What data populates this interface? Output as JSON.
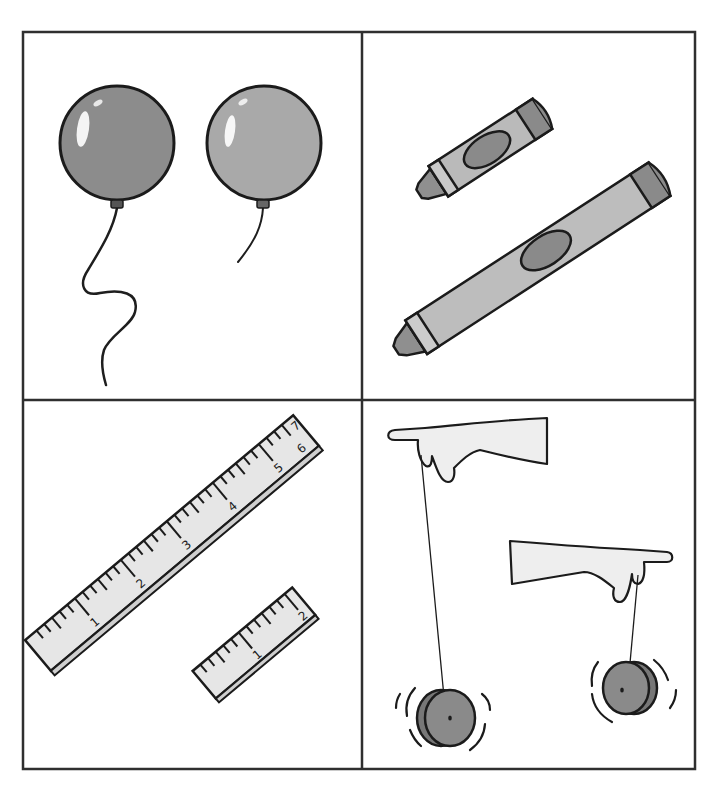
{
  "figure": {
    "layout": "2x2 picture grid",
    "border_color": "#333333",
    "cells": [
      {
        "position": "top-left",
        "subject": "balloons",
        "items": [
          {
            "name": "balloon-long-string",
            "fill": "#8c8c8c",
            "string": "long wavy"
          },
          {
            "name": "balloon-short-string",
            "fill": "#a9a9a9",
            "string": "short"
          }
        ]
      },
      {
        "position": "top-right",
        "subject": "crayons",
        "items": [
          {
            "name": "crayon-short",
            "body": "#b9b9b9",
            "label": "#8a8a8a"
          },
          {
            "name": "crayon-long",
            "body": "#bdbdbd",
            "label": "#8a8a8a"
          }
        ]
      },
      {
        "position": "bottom-left",
        "subject": "rulers",
        "items": [
          {
            "name": "ruler-long",
            "numbers": [
              "1",
              "2",
              "3",
              "4",
              "5",
              "6",
              "7"
            ]
          },
          {
            "name": "ruler-short",
            "numbers": [
              "1",
              "2"
            ]
          }
        ]
      },
      {
        "position": "bottom-right",
        "subject": "yo-yos",
        "items": [
          {
            "name": "yoyo-long-string",
            "fill": "#8a8a8a"
          },
          {
            "name": "yoyo-short-string",
            "fill": "#8a8a8a"
          }
        ]
      }
    ]
  },
  "ruler_long": {
    "n1": "1",
    "n2": "2",
    "n3": "3",
    "n4": "4",
    "n5": "5",
    "n6": "6",
    "n7": "7"
  },
  "ruler_short": {
    "n1": "1",
    "n2": "2"
  }
}
